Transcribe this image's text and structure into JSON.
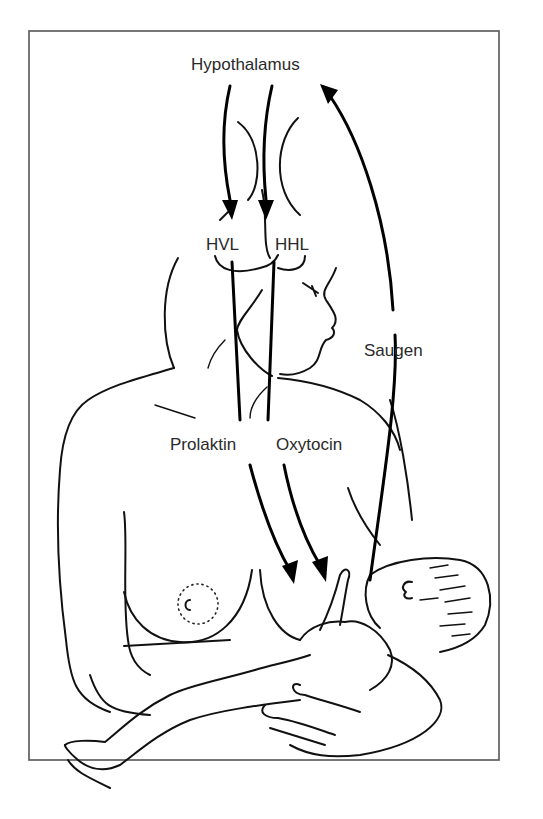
{
  "diagram": {
    "labels": {
      "hypothalamus": "Hypothalamus",
      "hvl": "HVL",
      "hhl": "HHL",
      "saugen": "Saugen",
      "prolaktin": "Prolaktin",
      "oxytocin": "Oxytocin"
    },
    "arrows": [
      {
        "from": "Hypothalamus",
        "to": "HVL"
      },
      {
        "from": "Hypothalamus",
        "to": "HHL"
      },
      {
        "from": "HVL",
        "to": "breast",
        "hormone": "Prolaktin"
      },
      {
        "from": "HHL",
        "to": "breast",
        "hormone": "Oxytocin"
      },
      {
        "from": "infant",
        "to": "Hypothalamus",
        "signal": "Saugen"
      }
    ],
    "colors": {
      "line": "#111111",
      "text": "#2a2a2a",
      "frame": "#555555",
      "background": "#ffffff"
    }
  }
}
